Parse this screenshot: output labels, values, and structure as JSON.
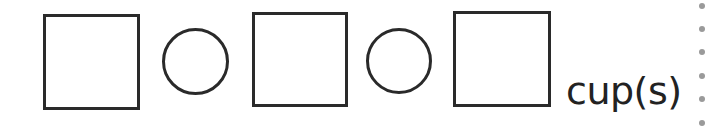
{
  "equation": {
    "slots": [
      {
        "type": "box",
        "value": ""
      },
      {
        "type": "operator-circle",
        "value": ""
      },
      {
        "type": "box",
        "value": ""
      },
      {
        "type": "operator-circle",
        "value": ""
      },
      {
        "type": "box",
        "value": ""
      }
    ],
    "unit": "cup(s)"
  },
  "divider": {
    "style": "dotted",
    "color": "#9a9a9a"
  }
}
